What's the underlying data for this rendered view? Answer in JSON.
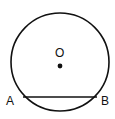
{
  "diagram": {
    "type": "circle-with-chord",
    "circle": {
      "cx": 60,
      "cy": 62,
      "r": 49,
      "stroke": "#111111"
    },
    "center": {
      "label": "O",
      "x": 60,
      "y": 66
    },
    "chord": {
      "x1": 23,
      "y1": 97,
      "x2": 97,
      "y2": 97,
      "stroke": "#111111"
    },
    "points": [
      {
        "label": "A",
        "x": 6,
        "y": 105
      },
      {
        "label": "B",
        "x": 101,
        "y": 105
      }
    ]
  }
}
